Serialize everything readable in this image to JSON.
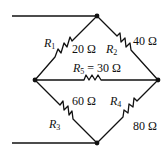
{
  "diagram": {
    "type": "wheatstone-bridge",
    "resistors": [
      {
        "id": "R1",
        "name": "R",
        "sub": "1",
        "value": "20 Ω"
      },
      {
        "id": "R2",
        "name": "R",
        "sub": "2",
        "value": "40 Ω"
      },
      {
        "id": "R3",
        "name": "R",
        "sub": "3",
        "value": "60 Ω"
      },
      {
        "id": "R4",
        "name": "R",
        "sub": "4",
        "value": "80 Ω"
      },
      {
        "id": "R5",
        "name": "R",
        "sub": "5",
        "value": "= 30 Ω"
      }
    ],
    "nodes": [
      "top",
      "left",
      "right",
      "bottom"
    ]
  }
}
